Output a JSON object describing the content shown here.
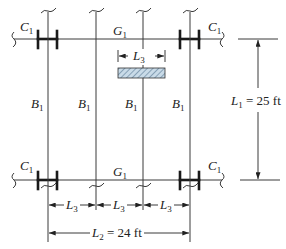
{
  "diagram": {
    "type": "floor framing plan",
    "colors": {
      "line": "#3a3a3a",
      "hatch_fill": "#c9dbe8",
      "hatch_stroke": "#5a7a94"
    },
    "labels": {
      "column": {
        "sym": "C",
        "sub": "1"
      },
      "girder": {
        "sym": "G",
        "sub": "1"
      },
      "beam": {
        "sym": "B",
        "sub": "1"
      }
    },
    "dimensions": {
      "L1": {
        "sym": "L",
        "sub": "1",
        "value": " = 25 ft"
      },
      "L2": {
        "sym": "L",
        "sub": "2",
        "value": " = 24 ft"
      },
      "L3": {
        "sym": "L",
        "sub": "3",
        "value": ""
      }
    },
    "columns_x": [
      48,
      96,
      143,
      190
    ],
    "girders_y": [
      39,
      180
    ],
    "hatched_load": {
      "x": 118,
      "y": 68,
      "w": 47,
      "h": 10
    }
  }
}
